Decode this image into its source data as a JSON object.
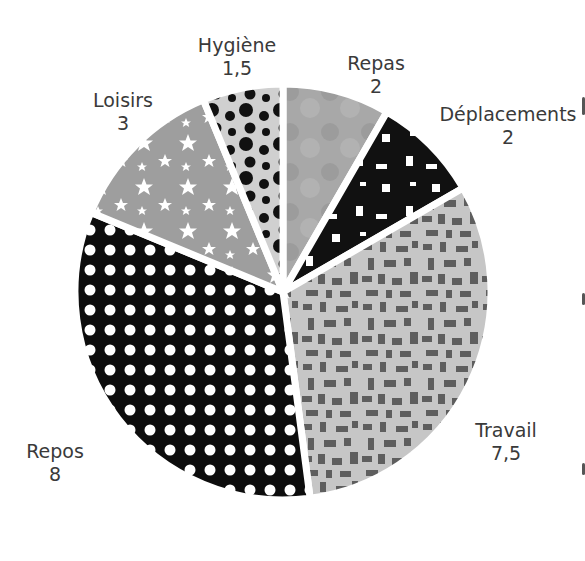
{
  "chart_data": {
    "type": "pie",
    "unit": "heures",
    "total": 24,
    "start_angle_deg": 0,
    "direction": "clockwise",
    "slices": [
      {
        "label": "Repas",
        "value": 2,
        "value_label": "2",
        "pattern": "mottled-gray",
        "color": "#a6a6a6"
      },
      {
        "label": "Déplacements",
        "value": 2,
        "value_label": "2",
        "pattern": "black-with-white-rects",
        "color": "#111111"
      },
      {
        "label": "Travail",
        "value": 7.5,
        "value_label": "7,5",
        "pattern": "light-gray-with-dark-rects",
        "color": "#c4c4c4"
      },
      {
        "label": "Repos",
        "value": 8,
        "value_label": "8",
        "pattern": "black-with-white-dots",
        "color": "#0d0d0d"
      },
      {
        "label": "Loisirs",
        "value": 3,
        "value_label": "3",
        "pattern": "gray-with-white-stars",
        "color": "#9e9e9e"
      },
      {
        "label": "Hygiène",
        "value": 1.5,
        "value_label": "1,5",
        "pattern": "light-gray-with-black-circles",
        "color": "#d0d0d0"
      }
    ],
    "legend": "none",
    "labels_position": "outside"
  },
  "labels": {
    "repas": {
      "name": "Repas",
      "value": "2"
    },
    "deplacements": {
      "name": "Déplacements",
      "value": "2"
    },
    "travail": {
      "name": "Travail",
      "value": "7,5"
    },
    "repos": {
      "name": "Repos",
      "value": "8"
    },
    "loisirs": {
      "name": "Loisirs",
      "value": "3"
    },
    "hygiene": {
      "name": "Hygiène",
      "value": "1,5"
    }
  }
}
